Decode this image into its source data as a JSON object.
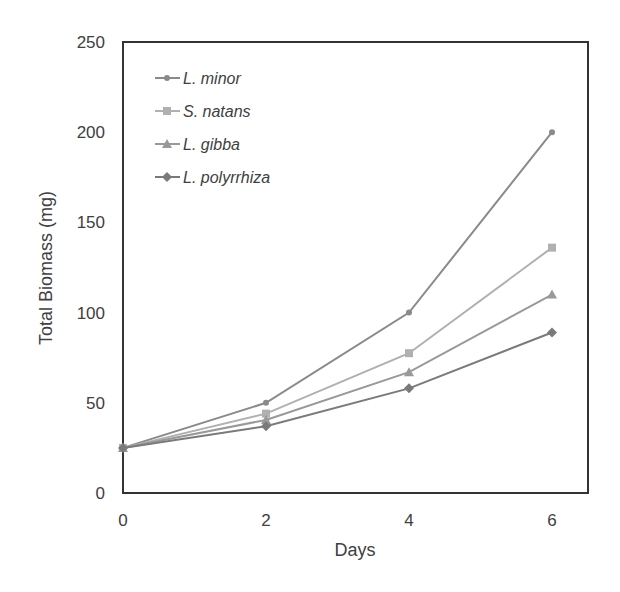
{
  "chart_data": {
    "type": "line",
    "title": "",
    "xlabel": "Days",
    "ylabel": "Total Biomass (mg)",
    "x": [
      0,
      2,
      4,
      6
    ],
    "xticks": [
      "0",
      "2",
      "4",
      "6"
    ],
    "yticks": [
      "0",
      "50",
      "100",
      "150",
      "200",
      "250"
    ],
    "xlim": [
      0,
      6.5
    ],
    "ylim": [
      0,
      250
    ],
    "grid": false,
    "legend_position": "upper-left-inside",
    "series": [
      {
        "name": "L. minor",
        "marker": "circle",
        "color": "#8a8a8a",
        "values": [
          25,
          50,
          100,
          200
        ]
      },
      {
        "name": "S. natans",
        "marker": "square",
        "color": "#b0b0b0",
        "values": [
          25,
          44,
          77.5,
          136
        ]
      },
      {
        "name": "L. gibba",
        "marker": "triangle",
        "color": "#999999",
        "values": [
          25,
          40.5,
          67,
          110
        ]
      },
      {
        "name": "L. polyrrhiza",
        "marker": "diamond",
        "color": "#7a7a7a",
        "values": [
          25,
          37,
          58,
          89
        ]
      }
    ]
  }
}
